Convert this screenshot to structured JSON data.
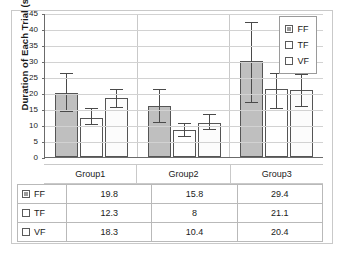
{
  "chart_data": {
    "type": "bar",
    "title": "",
    "xlabel": "",
    "ylabel": "Duration of Each Trial (s)",
    "ylim": [
      0,
      45
    ],
    "ytick_step": 5,
    "yticks": [
      "0",
      "5",
      "10",
      "15",
      "20",
      "25",
      "30",
      "35",
      "40",
      "45"
    ],
    "grid": true,
    "legend_position": "top-right",
    "categories": [
      "Group1",
      "Group2",
      "Group3"
    ],
    "series": [
      {
        "name": "FF",
        "color": "#bfbfbf",
        "values": [
          19.8,
          15.8,
          29.4
        ],
        "plotted": [
          20.0,
          16.0,
          30.0
        ],
        "error_low": [
          14.0,
          10.7,
          17.0
        ],
        "error_high": [
          26.0,
          21.0,
          42.0
        ]
      },
      {
        "name": "TF",
        "color": "#ffffff",
        "values": [
          12.3,
          8,
          21.1
        ],
        "plotted": [
          12.3,
          8.3,
          21.3
        ],
        "error_low": [
          10.0,
          6.2,
          15.0
        ],
        "error_high": [
          15.0,
          10.4,
          26.0
        ]
      },
      {
        "name": "VF",
        "color": "#ffffff",
        "values": [
          18.3,
          10.4,
          20.4
        ],
        "plotted": [
          18.3,
          10.7,
          20.9
        ],
        "error_low": [
          15.2,
          8.5,
          15.5
        ],
        "error_high": [
          21.0,
          13.0,
          25.5
        ]
      }
    ],
    "data_table": {
      "row_labels": [
        "FF",
        "TF",
        "VF"
      ],
      "column_labels": [
        "Group1",
        "Group2",
        "Group3"
      ],
      "rows": [
        [
          "19.8",
          "15.8",
          "29.4"
        ],
        [
          "12.3",
          "8",
          "21.1"
        ],
        [
          "18.3",
          "10.4",
          "20.4"
        ]
      ]
    },
    "legend": [
      {
        "label": "FF",
        "swatch": "filled-gray"
      },
      {
        "label": "TF",
        "swatch": "empty-white"
      },
      {
        "label": "VF",
        "swatch": "empty-white"
      }
    ]
  }
}
